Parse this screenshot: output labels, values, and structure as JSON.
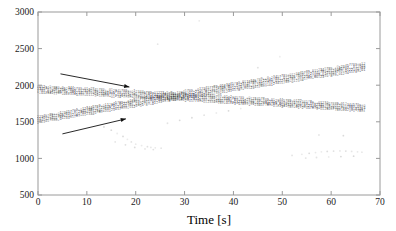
{
  "chart_data": {
    "type": "scatter",
    "title": "",
    "xlabel": "Time [s]",
    "ylabel": "",
    "xlim": [
      0,
      70
    ],
    "ylim": [
      500,
      3000
    ],
    "xticks": [
      0,
      10,
      20,
      30,
      40,
      50,
      60,
      70
    ],
    "yticks": [
      500,
      1000,
      1500,
      2000,
      2500,
      3000
    ],
    "xtick_labels": [
      "0",
      "10",
      "20",
      "30",
      "40",
      "50",
      "60",
      "70"
    ],
    "ytick_labels": [
      "500",
      "1000",
      "1500",
      "2000",
      "2500",
      "3000"
    ],
    "grid": false,
    "legend": "none",
    "marker_style": "tiny-numeric-glyph",
    "series": [
      {
        "name": "descending-band-trace-1",
        "group": "descending",
        "x": [
          0,
          4,
          8,
          12,
          16,
          20,
          24,
          28,
          32,
          36,
          40,
          44,
          48,
          52,
          56,
          60,
          64,
          67
        ],
        "values": [
          1975,
          1960,
          1948,
          1935,
          1922,
          1908,
          1893,
          1878,
          1862,
          1845,
          1828,
          1812,
          1795,
          1778,
          1762,
          1745,
          1728,
          1716
        ]
      },
      {
        "name": "descending-band-trace-2",
        "group": "descending",
        "x": [
          0,
          4,
          8,
          12,
          16,
          20,
          24,
          28,
          32,
          36,
          40,
          44,
          48,
          52,
          56,
          60,
          64,
          67
        ],
        "values": [
          1948,
          1934,
          1921,
          1908,
          1894,
          1880,
          1866,
          1850,
          1834,
          1818,
          1801,
          1784,
          1768,
          1751,
          1735,
          1718,
          1702,
          1690
        ]
      },
      {
        "name": "descending-band-trace-3",
        "group": "descending",
        "x": [
          0,
          4,
          8,
          12,
          16,
          20,
          24,
          28,
          32,
          36,
          40,
          44,
          48,
          52,
          56,
          60,
          64,
          67
        ],
        "values": [
          1920,
          1907,
          1894,
          1881,
          1867,
          1853,
          1838,
          1823,
          1807,
          1791,
          1774,
          1758,
          1741,
          1725,
          1708,
          1692,
          1676,
          1664
        ]
      },
      {
        "name": "descending-band-trace-4",
        "group": "descending",
        "x": [
          0,
          4,
          8,
          12,
          16,
          20,
          24,
          28,
          32,
          36,
          40,
          44,
          48,
          52,
          56,
          60,
          64,
          67
        ],
        "values": [
          1896,
          1883,
          1870,
          1857,
          1843,
          1829,
          1814,
          1799,
          1783,
          1767,
          1750,
          1734,
          1718,
          1701,
          1685,
          1669,
          1653,
          1641
        ]
      },
      {
        "name": "ascending-band-trace-1",
        "group": "ascending",
        "x": [
          0,
          4,
          8,
          12,
          16,
          20,
          24,
          28,
          32,
          36,
          40,
          44,
          48,
          52,
          56,
          60,
          64,
          67
        ],
        "values": [
          1560,
          1608,
          1655,
          1702,
          1748,
          1793,
          1838,
          1882,
          1926,
          1970,
          2013,
          2056,
          2098,
          2140,
          2182,
          2224,
          2266,
          2296
        ]
      },
      {
        "name": "ascending-band-trace-2",
        "group": "ascending",
        "x": [
          0,
          4,
          8,
          12,
          16,
          20,
          24,
          28,
          32,
          36,
          40,
          44,
          48,
          52,
          56,
          60,
          64,
          67
        ],
        "values": [
          1535,
          1582,
          1629,
          1675,
          1721,
          1766,
          1810,
          1854,
          1898,
          1941,
          1984,
          2027,
          2069,
          2111,
          2152,
          2194,
          2235,
          2265
        ]
      },
      {
        "name": "ascending-band-trace-3",
        "group": "ascending",
        "x": [
          0,
          4,
          8,
          12,
          16,
          20,
          24,
          28,
          32,
          36,
          40,
          44,
          48,
          52,
          56,
          60,
          64,
          67
        ],
        "values": [
          1510,
          1556,
          1602,
          1648,
          1693,
          1738,
          1782,
          1826,
          1869,
          1912,
          1955,
          1997,
          2039,
          2081,
          2122,
          2163,
          2204,
          2234
        ]
      },
      {
        "name": "ascending-band-trace-4",
        "group": "ascending",
        "x": [
          0,
          4,
          8,
          12,
          16,
          20,
          24,
          28,
          32,
          36,
          40,
          44,
          48,
          52,
          56,
          60,
          64,
          67
        ],
        "values": [
          1486,
          1531,
          1577,
          1622,
          1667,
          1711,
          1755,
          1798,
          1841,
          1884,
          1926,
          1968,
          2010,
          2051,
          2092,
          2133,
          2173,
          2203
        ]
      }
    ],
    "outliers": {
      "name": "scattered-outliers",
      "x": [
        13.5,
        15.0,
        16.2,
        17.4,
        18.3,
        19.1,
        20.0,
        21.2,
        22.4,
        23.1,
        24.0,
        25.2,
        15.8,
        17.9,
        19.8,
        21.9,
        23.6,
        26.5,
        29.0,
        31.5,
        34.0,
        36.5,
        39.0,
        41.5,
        52.0,
        54.0,
        55.5,
        56.8,
        58.0,
        59.2,
        60.5,
        61.8,
        63.0,
        64.2,
        65.4,
        66.3,
        54.8,
        57.0,
        59.5,
        62.0,
        64.6,
        24.5,
        33.0,
        45.0,
        49.5,
        57.5,
        62.5
      ],
      "values": [
        1430,
        1385,
        1340,
        1300,
        1260,
        1225,
        1195,
        1175,
        1160,
        1150,
        1145,
        1140,
        1225,
        1185,
        1150,
        1130,
        1120,
        1480,
        1520,
        1555,
        1590,
        1620,
        1650,
        1680,
        1040,
        1055,
        1070,
        1080,
        1090,
        1095,
        1100,
        1102,
        1100,
        1095,
        1090,
        1085,
        1005,
        1012,
        1020,
        1025,
        1030,
        2560,
        2880,
        2240,
        2390,
        1320,
        1310
      ]
    },
    "annotations": [
      {
        "name": "upper-arrow",
        "type": "arrow",
        "x_start": 4.6,
        "y_start": 2155,
        "x_end": 18.7,
        "y_end": 1975
      },
      {
        "name": "lower-arrow",
        "type": "arrow",
        "x_start": 5.0,
        "y_start": 1335,
        "x_end": 18.0,
        "y_end": 1540
      }
    ]
  },
  "axes": {
    "x_title": "Time [s]"
  }
}
